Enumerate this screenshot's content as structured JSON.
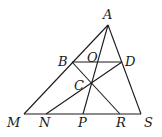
{
  "diagram": {
    "type": "geometry",
    "points": {
      "A": {
        "label": "A",
        "x": 108,
        "y": 25,
        "lx": 103,
        "ly": 19
      },
      "B": {
        "label": "B",
        "x": 72,
        "y": 62,
        "lx": 58,
        "ly": 66
      },
      "O": {
        "label": "O",
        "x": 96,
        "y": 62,
        "lx": 87,
        "ly": 62
      },
      "D": {
        "label": "D",
        "x": 122,
        "y": 62,
        "lx": 125,
        "ly": 66
      },
      "C": {
        "label": "C",
        "x": 91,
        "y": 84,
        "lx": 74,
        "ly": 90
      },
      "M": {
        "label": "M",
        "x": 24,
        "y": 114,
        "lx": 7,
        "ly": 127
      },
      "N": {
        "label": "N",
        "x": 46,
        "y": 114,
        "lx": 39,
        "ly": 127
      },
      "P": {
        "label": "P",
        "x": 83,
        "y": 114,
        "lx": 78,
        "ly": 127
      },
      "R": {
        "label": "R",
        "x": 120,
        "y": 114,
        "lx": 116,
        "ly": 127
      },
      "S": {
        "label": "S",
        "x": 141,
        "y": 114,
        "lx": 144,
        "ly": 127
      }
    },
    "segments": [
      [
        "A",
        "M"
      ],
      [
        "A",
        "S"
      ],
      [
        "M",
        "S"
      ],
      [
        "B",
        "D"
      ],
      [
        "A",
        "P"
      ],
      [
        "B",
        "R"
      ],
      [
        "D",
        "N"
      ]
    ]
  }
}
